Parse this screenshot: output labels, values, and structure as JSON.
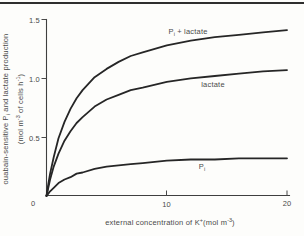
{
  "chart_data": {
    "type": "line",
    "title": "",
    "xlabel": "external concentration of K+ (mol m-3)",
    "ylabel": "ouabain-sensitive Pi and lactate production (mol m-3 of cells h-1)",
    "xlim": [
      0,
      20
    ],
    "ylim": [
      0,
      1.5
    ],
    "x_ticks": [
      0,
      10,
      20
    ],
    "y_ticks": [
      0,
      0.5,
      1.0,
      1.5
    ],
    "grid": false,
    "legend_position": "inline-labels",
    "x": [
      0,
      0.15,
      0.3,
      0.6,
      1,
      1.5,
      2,
      2.5,
      3,
      4,
      5,
      6,
      7,
      8,
      10,
      12,
      14,
      16,
      18,
      20
    ],
    "series": [
      {
        "name": "Pi + lactate",
        "values": [
          0,
          0.1,
          0.19,
          0.33,
          0.49,
          0.63,
          0.74,
          0.83,
          0.9,
          1.01,
          1.08,
          1.14,
          1.19,
          1.22,
          1.28,
          1.32,
          1.35,
          1.37,
          1.39,
          1.41
        ]
      },
      {
        "name": "lactate",
        "values": [
          0,
          0.07,
          0.14,
          0.25,
          0.36,
          0.47,
          0.55,
          0.62,
          0.67,
          0.76,
          0.82,
          0.86,
          0.9,
          0.92,
          0.97,
          1.0,
          1.02,
          1.04,
          1.06,
          1.07
        ]
      },
      {
        "name": "Pi",
        "values": [
          0,
          0.02,
          0.04,
          0.07,
          0.11,
          0.14,
          0.16,
          0.19,
          0.2,
          0.23,
          0.25,
          0.26,
          0.27,
          0.28,
          0.3,
          0.31,
          0.31,
          0.32,
          0.32,
          0.32
        ]
      }
    ]
  },
  "axis_ticks": {
    "y": [
      "1.5",
      "1.0",
      "0.5"
    ],
    "x": [
      "10",
      "20"
    ],
    "origin": "0"
  },
  "xlabel": {
    "pre": "external concentration of K",
    "sup": "+",
    "mid": "(mol m",
    "sup2": "-3",
    "close": ")"
  },
  "ylabel": {
    "line1_pre": "ouabain-sensitive P",
    "line1_sub": "i",
    "line1_post": " and lactate production",
    "line2_pre": "(mol m",
    "line2_sup_a": "-3",
    "line2_mid": " of cells h",
    "line2_sup_b": "-1",
    "line2_close": ")"
  },
  "curve_labels": {
    "c1_pre": "P",
    "c1_sub": "i",
    "c1_post": " + lactate",
    "c2": "lactate",
    "c3_pre": "P",
    "c3_sub": "i"
  },
  "colors": {
    "curve": "#262626",
    "axis": "#3f3f3f",
    "text": "#4a4a4a",
    "background": "#fdfdfb",
    "top_rule": "#2e2e2e"
  }
}
